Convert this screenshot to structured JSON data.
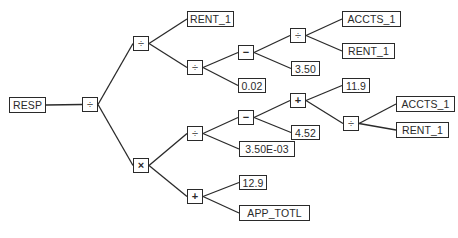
{
  "diagram": {
    "type": "expression-tree",
    "output_label": "RESP",
    "colors": {
      "line": "#2a2a2a",
      "background": "#ffffff"
    },
    "nodes": [
      {
        "id": "resp",
        "label": "RESP",
        "kind": "output",
        "x": 9,
        "y": 97,
        "w": 37,
        "h": 16
      },
      {
        "id": "op_root",
        "label": "÷",
        "kind": "operator",
        "x": 82,
        "y": 97,
        "w": 16,
        "h": 15
      },
      {
        "id": "op_a",
        "label": "÷",
        "kind": "operator",
        "x": 133,
        "y": 36,
        "w": 16,
        "h": 15
      },
      {
        "id": "leaf_rent_top",
        "label": "RENT_1",
        "kind": "leaf",
        "x": 187,
        "y": 11,
        "w": 47,
        "h": 16
      },
      {
        "id": "op_b",
        "label": "÷",
        "kind": "operator",
        "x": 187,
        "y": 60,
        "w": 16,
        "h": 15
      },
      {
        "id": "op_c",
        "label": "−",
        "kind": "operator",
        "x": 238,
        "y": 45,
        "w": 16,
        "h": 15
      },
      {
        "id": "op_d",
        "label": "÷",
        "kind": "operator",
        "x": 290,
        "y": 28,
        "w": 16,
        "h": 15
      },
      {
        "id": "leaf_accts_a",
        "label": "ACCTS_1",
        "kind": "leaf",
        "x": 342,
        "y": 11,
        "w": 59,
        "h": 16
      },
      {
        "id": "leaf_rent_a",
        "label": "RENT_1",
        "kind": "leaf",
        "x": 342,
        "y": 43,
        "w": 53,
        "h": 16
      },
      {
        "id": "leaf_350",
        "label": "3.50",
        "kind": "leaf",
        "x": 291,
        "y": 61,
        "w": 29,
        "h": 15
      },
      {
        "id": "leaf_002",
        "label": "0.02",
        "kind": "leaf",
        "x": 238,
        "y": 78,
        "w": 28,
        "h": 15
      },
      {
        "id": "op_mul",
        "label": "×",
        "kind": "operator",
        "x": 133,
        "y": 158,
        "w": 16,
        "h": 15
      },
      {
        "id": "op_e",
        "label": "÷",
        "kind": "operator",
        "x": 187,
        "y": 126,
        "w": 16,
        "h": 15
      },
      {
        "id": "op_f",
        "label": "−",
        "kind": "operator",
        "x": 238,
        "y": 110,
        "w": 16,
        "h": 15
      },
      {
        "id": "op_g",
        "label": "+",
        "kind": "operator",
        "x": 290,
        "y": 93,
        "w": 16,
        "h": 15
      },
      {
        "id": "leaf_119",
        "label": "11.9",
        "kind": "leaf",
        "x": 342,
        "y": 78,
        "w": 28,
        "h": 15
      },
      {
        "id": "op_h",
        "label": "÷",
        "kind": "operator",
        "x": 343,
        "y": 116,
        "w": 16,
        "h": 15
      },
      {
        "id": "leaf_accts_b",
        "label": "ACCTS_1",
        "kind": "leaf",
        "x": 396,
        "y": 96,
        "w": 59,
        "h": 16
      },
      {
        "id": "leaf_rent_b",
        "label": "RENT_1",
        "kind": "leaf",
        "x": 396,
        "y": 122,
        "w": 53,
        "h": 16
      },
      {
        "id": "leaf_452",
        "label": "4.52",
        "kind": "leaf",
        "x": 291,
        "y": 125,
        "w": 29,
        "h": 15
      },
      {
        "id": "leaf_350e",
        "label": "3.50E-03",
        "kind": "leaf",
        "x": 239,
        "y": 141,
        "w": 56,
        "h": 16
      },
      {
        "id": "op_i",
        "label": "+",
        "kind": "operator",
        "x": 187,
        "y": 189,
        "w": 16,
        "h": 15
      },
      {
        "id": "leaf_129",
        "label": "12.9",
        "kind": "leaf",
        "x": 239,
        "y": 175,
        "w": 28,
        "h": 15
      },
      {
        "id": "leaf_app",
        "label": "APP_TOTL",
        "kind": "leaf",
        "x": 239,
        "y": 205,
        "w": 71,
        "h": 16
      }
    ],
    "edges": [
      [
        "resp",
        "op_root"
      ],
      [
        "op_root",
        "op_a"
      ],
      [
        "op_root",
        "op_mul"
      ],
      [
        "op_a",
        "leaf_rent_top"
      ],
      [
        "op_a",
        "op_b"
      ],
      [
        "op_b",
        "op_c"
      ],
      [
        "op_b",
        "leaf_002"
      ],
      [
        "op_c",
        "op_d"
      ],
      [
        "op_c",
        "leaf_350"
      ],
      [
        "op_d",
        "leaf_accts_a"
      ],
      [
        "op_d",
        "leaf_rent_a"
      ],
      [
        "op_mul",
        "op_e"
      ],
      [
        "op_mul",
        "op_i"
      ],
      [
        "op_e",
        "op_f"
      ],
      [
        "op_e",
        "leaf_350e"
      ],
      [
        "op_f",
        "op_g"
      ],
      [
        "op_f",
        "leaf_452"
      ],
      [
        "op_g",
        "leaf_119"
      ],
      [
        "op_g",
        "op_h"
      ],
      [
        "op_h",
        "leaf_accts_b"
      ],
      [
        "op_h",
        "leaf_rent_b"
      ],
      [
        "op_i",
        "leaf_129"
      ],
      [
        "op_i",
        "leaf_app"
      ]
    ]
  }
}
